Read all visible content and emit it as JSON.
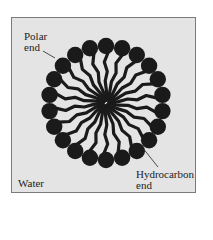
{
  "diagram": {
    "labels": {
      "polar_line1": "Polar",
      "polar_line2": "end",
      "hydro_line1": "Hydrocarbon",
      "hydro_line2": "end",
      "medium": "Water"
    },
    "molecule_count": 22,
    "colors": {
      "background": "#e4e4e4",
      "molecule": "#1a1a1a",
      "border": "#7a7a7a"
    }
  }
}
